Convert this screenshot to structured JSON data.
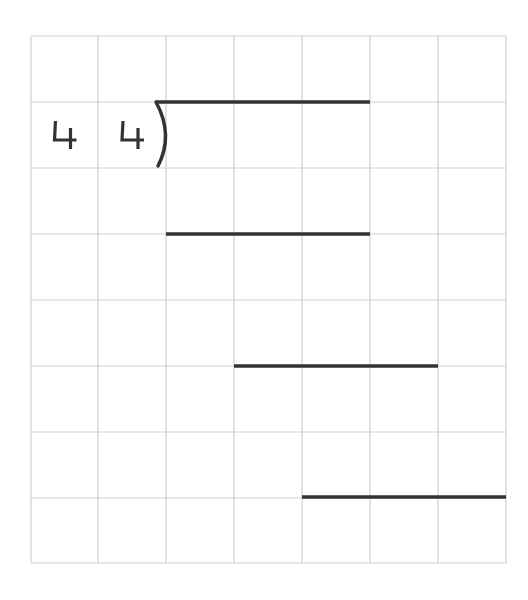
{
  "worksheet": {
    "type": "long-division-grid",
    "grid": {
      "columns": 7,
      "rows": 8,
      "left": 31,
      "top": 36,
      "col_edges": [
        31,
        98,
        166,
        234,
        302,
        370,
        438,
        506
      ],
      "row_edges": [
        36,
        102,
        168,
        234,
        300,
        366,
        432,
        498,
        563
      ],
      "line_color": "#cfcfcf"
    },
    "divisor": {
      "digits": [
        "4",
        "4"
      ],
      "cells": [
        [
          0,
          1
        ],
        [
          1,
          1
        ]
      ]
    },
    "division_bracket": {
      "x": 156,
      "y_top": 102,
      "y_bottom": 168,
      "color": "#333333"
    },
    "work_lines": [
      {
        "label": "quotient-bar",
        "x1": 156,
        "x2": 370,
        "y": 102
      },
      {
        "label": "subtraction-line-1",
        "x1": 166,
        "x2": 370,
        "y": 234
      },
      {
        "label": "subtraction-line-2",
        "x1": 234,
        "x2": 438,
        "y": 366
      },
      {
        "label": "subtraction-line-3",
        "x1": 302,
        "x2": 506,
        "y": 497
      }
    ],
    "ink_color": "#333333"
  }
}
